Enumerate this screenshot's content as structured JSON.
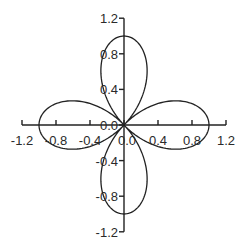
{
  "chart_data": {
    "type": "line",
    "subtype": "parametric-polar",
    "title": "",
    "xlabel": "",
    "ylabel": "",
    "equation": "r = cos(2θ)",
    "xlim": [
      -1.2,
      1.2
    ],
    "ylim": [
      -1.2,
      1.2
    ],
    "grid": false,
    "legend": null,
    "x_ticks": [
      -1.2,
      -0.8,
      -0.4,
      0.0,
      0.4,
      0.8,
      1.2
    ],
    "x_tick_labels": [
      "-1.2",
      "-0.8",
      "-0.4",
      "0.0",
      "0.4",
      "0.8",
      "1.2"
    ],
    "y_ticks": [
      1.2,
      0.8,
      0.4,
      0.0,
      -0.4,
      -0.8,
      -1.2
    ],
    "y_tick_labels": [
      "1.2",
      "0.8",
      "0.4",
      "0.0",
      "-0.4",
      "-0.8",
      "-1.2"
    ],
    "series": [
      {
        "name": "four-leaf rose",
        "description": "Four petals with tips at (1,0), (0,1), (-1,0), (0,-1)",
        "petal_tips": [
          [
            1.0,
            0.0
          ],
          [
            0.0,
            1.0
          ],
          [
            -1.0,
            0.0
          ],
          [
            0.0,
            -1.0
          ]
        ],
        "samples": 360
      }
    ],
    "colors": {
      "line": "#222222",
      "axis": "#222222",
      "text": "#2a2a2a",
      "background": "#ffffff"
    }
  },
  "layout": {
    "origin_px": [
      124,
      125
    ],
    "x_px_per_unit": 85,
    "y_px_per_unit": 89
  }
}
